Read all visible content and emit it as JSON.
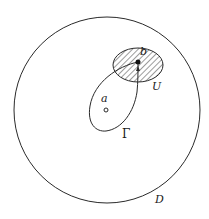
{
  "diagram": {
    "type": "complex-analysis-domain",
    "colors": {
      "stroke": "#2a2a2a",
      "background": "#ffffff",
      "hatch": "#3a3a3a"
    },
    "domain_D": {
      "label": "D",
      "shape": "circle"
    },
    "neighborhood_U": {
      "label": "U",
      "shape": "ellipse",
      "fill": "hatched"
    },
    "point_a": {
      "label": "a",
      "marker": "open-circle"
    },
    "point_b": {
      "label": "b",
      "marker": "filled-dot"
    },
    "curve_Gamma": {
      "label": "Γ",
      "shape": "closed-loop",
      "arrow": "upward-into-b"
    }
  }
}
